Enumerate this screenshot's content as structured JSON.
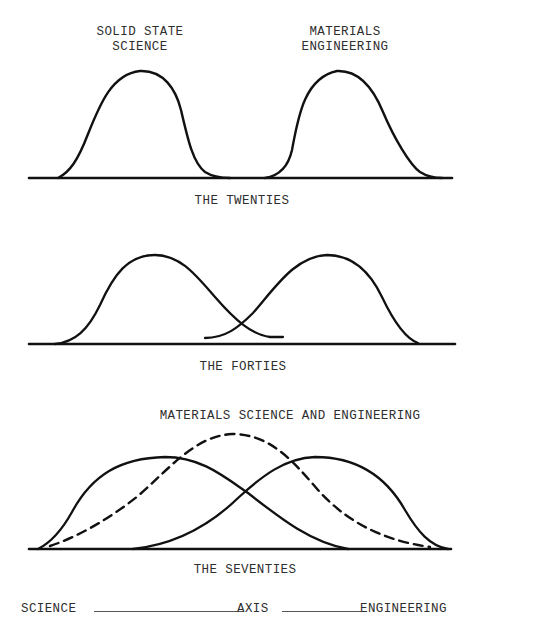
{
  "panels": {
    "twenties": {
      "caption": "THE TWENTIES",
      "left_label_line1": "SOLID STATE",
      "left_label_line2": "SCIENCE",
      "right_label_line1": "MATERIALS",
      "right_label_line2": "ENGINEERING"
    },
    "forties": {
      "caption": "THE FORTIES"
    },
    "seventies": {
      "title": "MATERIALS SCIENCE AND ENGINEERING",
      "caption": "THE SEVENTIES"
    }
  },
  "axis": {
    "left": "SCIENCE",
    "middle": "AXIS",
    "right": "ENGINEERING"
  },
  "colors": {
    "ink": "#111111",
    "text": "#2e2e2e",
    "background": "#ffffff"
  }
}
